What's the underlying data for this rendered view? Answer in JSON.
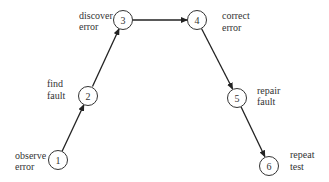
{
  "diagram": {
    "nodes": [
      {
        "id": "1",
        "label_lines": [
          "observe",
          "error"
        ]
      },
      {
        "id": "2",
        "label_lines": [
          "find",
          "fault"
        ]
      },
      {
        "id": "3",
        "label_lines": [
          "discover",
          "error"
        ]
      },
      {
        "id": "4",
        "label_lines": [
          "correct",
          "error"
        ]
      },
      {
        "id": "5",
        "label_lines": [
          "repair",
          "fault"
        ]
      },
      {
        "id": "6",
        "label_lines": [
          "repeat",
          "test"
        ]
      }
    ],
    "edges": [
      {
        "from": "1",
        "to": "2"
      },
      {
        "from": "2",
        "to": "3"
      },
      {
        "from": "3",
        "to": "4"
      },
      {
        "from": "4",
        "to": "5"
      },
      {
        "from": "5",
        "to": "6"
      }
    ]
  }
}
